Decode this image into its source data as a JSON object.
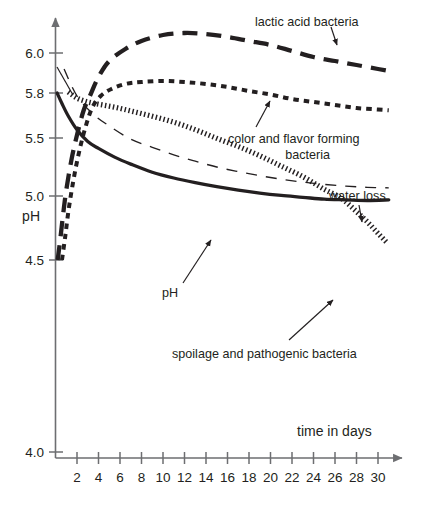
{
  "chart_data": {
    "type": "line",
    "title": "",
    "subtitle": "",
    "xlabel": "time in days",
    "ylabel": "pH",
    "grid": false,
    "legend_position": "inline-annotations",
    "x_ticks": [
      2,
      4,
      6,
      8,
      10,
      12,
      14,
      16,
      18,
      20,
      22,
      24,
      26,
      28,
      30
    ],
    "x_tick_labels": [
      "2",
      "4",
      "6",
      "8",
      "10",
      "12",
      "14",
      "16",
      "18",
      "20",
      "22",
      "24",
      "26",
      "28",
      "30"
    ],
    "xlim": [
      0,
      31
    ],
    "y_ticks": [
      6.0,
      5.8,
      5.5,
      5.0,
      4.5,
      4.0
    ],
    "y_tick_labels": [
      "6.0",
      "5.8",
      "5.5",
      "5.0",
      "4.5",
      "4.0"
    ],
    "ylim": [
      4.0,
      6.15
    ],
    "y_axis_note": "non-linear / broken axis between 4.5 and 4.0",
    "series": [
      {
        "name": "lactic acid bacteria",
        "style": "long-dash",
        "label": "lactic acid bacteria",
        "x": [
          0.2,
          0.4,
          0.7,
          1.0,
          1.5,
          2.0,
          2.6,
          3.2,
          4.0,
          5.0,
          6.5,
          8.0,
          10.0,
          12.0,
          14.0,
          16.0,
          18.0,
          20.0,
          22.0,
          24.0,
          26.0,
          28.0,
          30.0,
          31.0
        ],
        "values": [
          4.5,
          4.63,
          4.85,
          5.05,
          5.32,
          5.52,
          5.68,
          5.78,
          5.88,
          5.96,
          6.02,
          6.06,
          6.09,
          6.1,
          6.095,
          6.08,
          6.06,
          6.04,
          6.01,
          5.98,
          5.96,
          5.94,
          5.92,
          5.91
        ]
      },
      {
        "name": "color and flavor forming bacteria",
        "style": "short-dash",
        "label": "color and flavor forming bacteria",
        "x": [
          0.6,
          0.9,
          1.2,
          1.6,
          2.1,
          2.7,
          3.4,
          4.2,
          5.2,
          6.5,
          8.0,
          10.0,
          12.0,
          14.0,
          16.0,
          18.0,
          20.0,
          22.0,
          24.0,
          26.0,
          28.0,
          30.0,
          31.0
        ],
        "values": [
          4.5,
          4.68,
          4.88,
          5.1,
          5.34,
          5.55,
          5.7,
          5.78,
          5.82,
          5.845,
          5.855,
          5.86,
          5.855,
          5.845,
          5.83,
          5.81,
          5.79,
          5.76,
          5.74,
          5.72,
          5.7,
          5.69,
          5.685
        ]
      },
      {
        "name": "spoilage and pathogenic bacteria",
        "style": "hatched",
        "label": "spoilage and pathogenic bacteria",
        "x": [
          1.2,
          2.0,
          3.0,
          4.0,
          5.5,
          7.0,
          9.0,
          11.0,
          13.0,
          15.0,
          17.0,
          19.0,
          21.0,
          23.0,
          25.0,
          26.5,
          28.0,
          29.0,
          30.0,
          30.8
        ],
        "values": [
          5.8,
          5.76,
          5.735,
          5.72,
          5.7,
          5.675,
          5.64,
          5.6,
          5.55,
          5.49,
          5.42,
          5.34,
          5.25,
          5.16,
          5.05,
          4.98,
          4.87,
          4.79,
          4.7,
          4.63
        ]
      },
      {
        "name": "water loss",
        "style": "thin-dash",
        "label": "water loss",
        "x": [
          0.8,
          2.0,
          3.5,
          5.0,
          7.0,
          9.0,
          11.0,
          13.0,
          15.0,
          17.0,
          19.0,
          21.0,
          23.0,
          25.0,
          27.0,
          29.0,
          31.0
        ],
        "values": [
          5.92,
          5.78,
          5.66,
          5.58,
          5.49,
          5.42,
          5.355,
          5.3,
          5.25,
          5.21,
          5.175,
          5.145,
          5.12,
          5.1,
          5.085,
          5.075,
          5.07
        ]
      },
      {
        "name": "pH",
        "style": "solid",
        "label": "pH",
        "x": [
          0.15,
          0.6,
          1.2,
          2.0,
          3.0,
          4.0,
          5.5,
          7.0,
          9.0,
          11.0,
          13.0,
          15.0,
          17.0,
          19.0,
          21.0,
          23.0,
          25.0,
          27.0,
          29.0,
          31.0
        ],
        "values": [
          5.8,
          5.73,
          5.645,
          5.555,
          5.47,
          5.41,
          5.335,
          5.275,
          5.205,
          5.155,
          5.115,
          5.08,
          5.05,
          5.025,
          5.005,
          4.99,
          4.975,
          4.97,
          4.965,
          4.97
        ]
      }
    ],
    "annotations": [
      {
        "text": "lactic acid bacteria",
        "target_series": "lactic acid bacteria"
      },
      {
        "text": "color and flavor forming bacteria",
        "target_series": "color and flavor forming bacteria"
      },
      {
        "text": "water loss",
        "target_series": "water loss"
      },
      {
        "text": "pH",
        "target_series": "pH"
      },
      {
        "text": "spoilage and pathogenic bacteria",
        "target_series": "spoilage and pathogenic bacteria"
      }
    ]
  },
  "axes": {
    "y_label": "pH",
    "x_label": "time in days",
    "y_tick_labels": [
      "6.0",
      "5.8",
      "5.5",
      "5.0",
      "4.5",
      "4.0"
    ],
    "x_tick_labels": [
      "2",
      "4",
      "6",
      "8",
      "10",
      "12",
      "14",
      "16",
      "18",
      "20",
      "22",
      "24",
      "26",
      "28",
      "30"
    ]
  },
  "labels": {
    "lactic": "lactic acid bacteria",
    "color_flavor_line1": "color and flavor forming",
    "color_flavor_line2": "bacteria",
    "water_loss": "water loss",
    "ph": "pH",
    "spoilage": "spoilage and pathogenic bacteria"
  },
  "colors": {
    "ink": "#231f20",
    "axis": "#6d6e71",
    "background": "#ffffff"
  }
}
